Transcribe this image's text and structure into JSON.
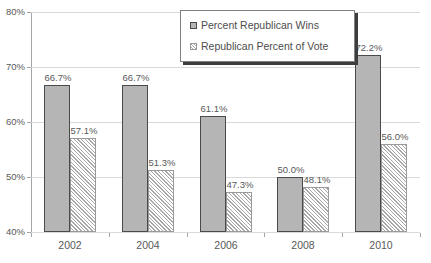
{
  "chart_data": {
    "type": "bar",
    "title": "",
    "xlabel": "",
    "ylabel": "",
    "ylim": [
      40,
      80
    ],
    "ytick_labels": [
      "40%",
      "50%",
      "60%",
      "70%",
      "80%"
    ],
    "ytick_values": [
      40,
      50,
      60,
      70,
      80
    ],
    "grid": true,
    "legend_position": "top-center",
    "categories": [
      "2002",
      "2004",
      "2006",
      "2008",
      "2010"
    ],
    "series": [
      {
        "name": "Percent Republican Wins",
        "values": [
          66.7,
          66.7,
          61.1,
          50.0,
          72.2
        ],
        "labels": [
          "66.7%",
          "66.7%",
          "61.1%",
          "50.0%",
          "72.2%"
        ],
        "style": "solid-gray",
        "color": "#b5b5b5"
      },
      {
        "name": "Republican Percent of Vote",
        "values": [
          57.1,
          51.3,
          47.3,
          48.1,
          56.0
        ],
        "labels": [
          "57.1%",
          "51.3%",
          "47.3%",
          "48.1%",
          "56.0%"
        ],
        "style": "diagonal-hatch",
        "color": "#ffffff"
      }
    ]
  },
  "legend": {
    "items": [
      {
        "label": "Percent Republican Wins",
        "swatch": "solid-gray-square-icon"
      },
      {
        "label": "Republican Percent of Vote",
        "swatch": "hatched-square-icon"
      }
    ]
  }
}
